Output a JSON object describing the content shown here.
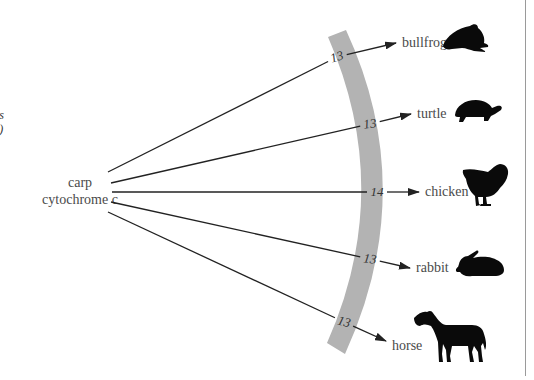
{
  "left_partial_text": {
    "line1": "es",
    "line2": "e)"
  },
  "source": {
    "line1": "carp",
    "line2": "cytochrome c"
  },
  "colors": {
    "band": "#b3b3b3",
    "arrow": "#222222",
    "silhouette": "#0a0a0a",
    "label": "#4a4a4a"
  },
  "targets": [
    {
      "name": "bullfrog",
      "differences": "13",
      "icon": "frog-icon"
    },
    {
      "name": "turtle",
      "differences": "13",
      "icon": "turtle-icon"
    },
    {
      "name": "chicken",
      "differences": "14",
      "icon": "chicken-icon"
    },
    {
      "name": "rabbit",
      "differences": "13",
      "icon": "rabbit-icon"
    },
    {
      "name": "horse",
      "differences": "13",
      "icon": "horse-icon"
    }
  ]
}
